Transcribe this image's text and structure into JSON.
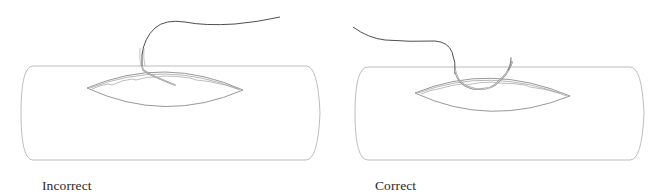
{
  "figure": {
    "panels": [
      {
        "id": "incorrect",
        "label": "Incorrect",
        "depicts": "suture needle entering wound at a shallow angle (incorrect technique)"
      },
      {
        "id": "correct",
        "label": "Correct",
        "depicts": "suture needle curving through the wound edge perpendicular to the skin (correct technique)"
      }
    ],
    "colors": {
      "outline": "#9a9a9a",
      "wound_edge": "#8c8c8c",
      "suture": "#3a3a3a",
      "needle": "#a8a8a8",
      "caption": "#2a2a2a"
    }
  }
}
